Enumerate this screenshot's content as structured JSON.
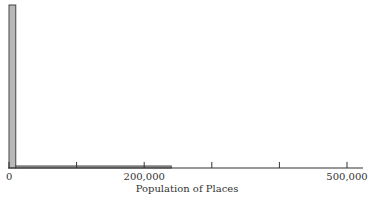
{
  "chart_data": {
    "type": "bar",
    "subtype": "histogram",
    "title": "",
    "xlabel": "Population of Places",
    "ylabel": "",
    "xlim": [
      0,
      500000
    ],
    "x_ticks": [
      0,
      100000,
      200000,
      300000,
      400000,
      500000
    ],
    "x_tick_labels": [
      "0",
      "",
      "200,000",
      "",
      "",
      "500,000"
    ],
    "bin_width": 10000,
    "bins": [
      {
        "start": 0,
        "end": 10000,
        "relative_height": 1.0
      },
      {
        "start": 10000,
        "end": 240000,
        "relative_height": 0.012
      }
    ],
    "grid": false,
    "legend": null,
    "bar_fill": "#b8b8b8",
    "bar_stroke": "#444444"
  }
}
